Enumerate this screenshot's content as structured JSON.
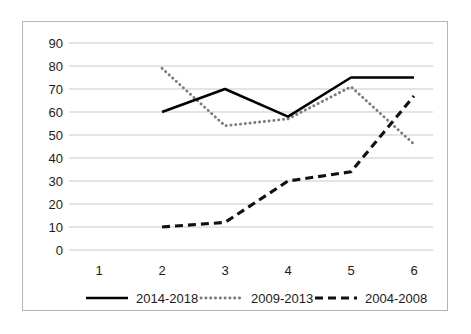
{
  "chart_data": {
    "type": "line",
    "title": "",
    "xlabel": "",
    "ylabel": "",
    "categories": [
      "1",
      "2",
      "3",
      "4",
      "5",
      "6"
    ],
    "ylim": [
      0,
      90
    ],
    "ytick_labels": [
      "0",
      "10",
      "20",
      "30",
      "40",
      "50",
      "60",
      "70",
      "80",
      "90"
    ],
    "ytick_values": [
      0,
      10,
      20,
      30,
      40,
      50,
      60,
      70,
      80,
      90
    ],
    "grid": true,
    "legend_position": "bottom",
    "series": [
      {
        "name": "2014-2018",
        "style": "solid",
        "color": "#000000",
        "x": [
          "2",
          "3",
          "4",
          "5",
          "6"
        ],
        "values": [
          60,
          70,
          58,
          75,
          75
        ]
      },
      {
        "name": "2009-2013",
        "style": "dotted",
        "color": "#7c7c7c",
        "x": [
          "2",
          "3",
          "4",
          "5",
          "6"
        ],
        "values": [
          79,
          54,
          57,
          71,
          46
        ]
      },
      {
        "name": "2004-2008",
        "style": "dashed",
        "color": "#111111",
        "x": [
          "2",
          "3",
          "4",
          "5",
          "6"
        ],
        "values": [
          10,
          12,
          30,
          34,
          67
        ]
      }
    ]
  },
  "legend": {
    "items": [
      {
        "label": "2014-2018"
      },
      {
        "label": "2009-2013"
      },
      {
        "label": "2004-2008"
      }
    ]
  },
  "axis": {
    "y_labels": [
      "90",
      "80",
      "70",
      "60",
      "50",
      "40",
      "30",
      "20",
      "10",
      "0"
    ],
    "x_labels": [
      "1",
      "2",
      "3",
      "4",
      "5",
      "6"
    ]
  },
  "colors": {
    "border": "#b6b6b6",
    "grid": "#c9c9c9",
    "text": "#1b1b1b",
    "background": "#ffffff"
  }
}
